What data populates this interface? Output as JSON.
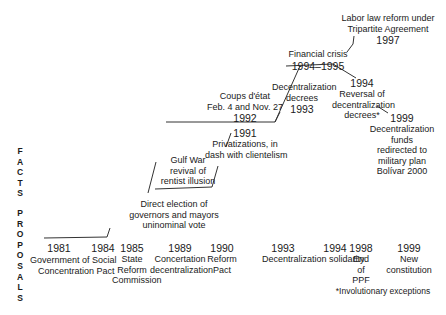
{
  "axis_labels": {
    "facts": [
      "F",
      "A",
      "C",
      "T",
      "S"
    ],
    "proposals": [
      "P",
      "R",
      "O",
      "P",
      "O",
      "S",
      "A",
      "L",
      "S"
    ]
  },
  "facts": [
    {
      "id": "direct-election",
      "year": "",
      "text": [
        "Direct election of",
        "governors and mayors",
        "uninominal vote"
      ]
    },
    {
      "id": "gulf-war",
      "year": "",
      "text": [
        "Gulf War",
        "revival of",
        "rentist illusion"
      ]
    },
    {
      "id": "privatizations",
      "year": "1991",
      "text": [
        "Privatizations, in",
        "dash with clientelism"
      ]
    },
    {
      "id": "coups",
      "year": "1992",
      "text": [
        "Coups d'état",
        "Feb. 4 and Nov. 27"
      ]
    },
    {
      "id": "decentralization-decrees",
      "year": "1993",
      "text": [
        "Decentralization",
        "decrees"
      ]
    },
    {
      "id": "financial-crisis",
      "year": "1994–1995",
      "text": [
        "Financial crisis"
      ]
    },
    {
      "id": "labor-law",
      "year": "1997",
      "text": [
        "Labor law reform under",
        "Tripartite Agreement"
      ]
    },
    {
      "id": "reversal",
      "year": "1994",
      "text": [
        "Reversal of",
        "decentralization",
        "decrees*"
      ]
    },
    {
      "id": "funds-redirected",
      "year": "1999",
      "text": [
        "Decentralization",
        "funds",
        "redirected to",
        "military plan",
        "Bolívar 2000"
      ]
    }
  ],
  "proposals": [
    {
      "year": "1981",
      "text": [
        "Government of Social"
      ]
    },
    {
      "year": "1984",
      "text": [
        "Concentration Pact"
      ]
    },
    {
      "year": "1985",
      "text": [
        "State",
        "Reform",
        "Commission"
      ]
    },
    {
      "year": "1989",
      "text": [
        "Concertation",
        "decentralization"
      ]
    },
    {
      "year": "1990",
      "text": [
        "Reform",
        "Pact"
      ]
    },
    {
      "year": "1993",
      "text": [
        "Decentralization solidarity"
      ]
    },
    {
      "year": "1994",
      "text": []
    },
    {
      "year": "1998",
      "text": [
        "End",
        "of",
        "PPF"
      ]
    },
    {
      "year": "1999",
      "text": [
        "New",
        "constitution"
      ]
    }
  ],
  "footnote": "*Involutionary exceptions"
}
